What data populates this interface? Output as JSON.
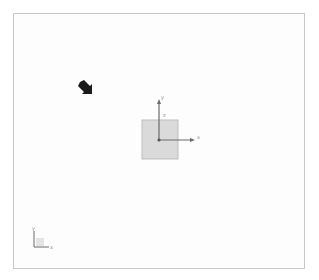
{
  "viewport": {
    "border_color": "#c8c8c8",
    "background": "#fdfdfd"
  },
  "cursor": {
    "icon": "arrow-cursor-icon",
    "color": "#1a1a1a"
  },
  "object": {
    "shape": "square-plane",
    "fill": "#dadada",
    "stroke": "#b8b8b8"
  },
  "object_axes": {
    "x_label": "x",
    "y_label": "y",
    "z_label": "z",
    "color": "#6b6b6b"
  },
  "view_triad": {
    "x_label": "x",
    "y_label": "y",
    "color": "#6b6b6b"
  }
}
